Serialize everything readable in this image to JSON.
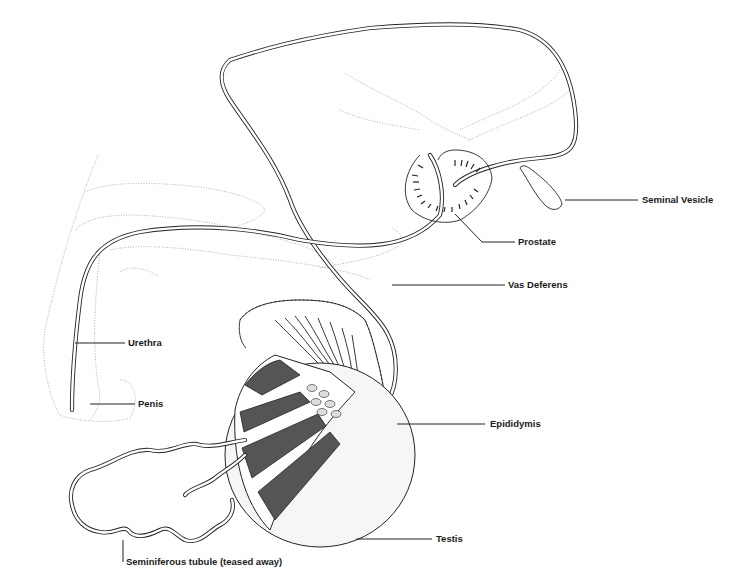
{
  "figure": {
    "line_color": "#222222",
    "outline_color": "#9a9a9a",
    "background": "#ffffff"
  },
  "labels": {
    "seminal_vesicle": "Seminal Vesicle",
    "prostate": "Prostate",
    "vas_deferens": "Vas Deferens",
    "urethra": "Urethra",
    "penis": "Penis",
    "epididymis": "Epididymis",
    "testis": "Testis",
    "seminiferous_tubule": "Seminiferous tubule (teased away)"
  }
}
